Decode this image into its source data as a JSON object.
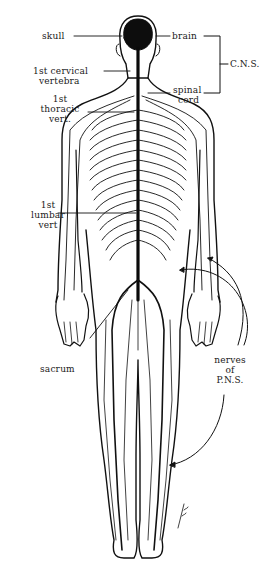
{
  "diagram": {
    "background": "#ffffff",
    "ink": "#111111",
    "labels": {
      "skull": "skull",
      "brain": "brain",
      "cervical_1": "1st cervical",
      "cervical_2": "vertebra",
      "spinal_1": "spinal",
      "spinal_2": "cord",
      "cns": "C.N.S.",
      "thoracic_1": "1st",
      "thoracic_2": "thoracic",
      "thoracic_3": "vert.",
      "lumbar_1": "1st",
      "lumbar_2": "lumbar",
      "lumbar_3": "vert",
      "sacrum": "sacrum",
      "pns_1": "nerves",
      "pns_2": "of",
      "pns_3": "P.N.S."
    },
    "groups": {
      "cns_bracket": [
        "brain",
        "spinal cord"
      ],
      "pns_arrows": 3
    },
    "signature": "artist-signature"
  }
}
